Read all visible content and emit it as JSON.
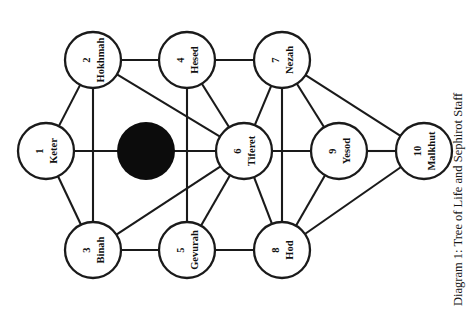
{
  "figure": {
    "caption": "Diagram 1: Tree of Life and Sephirot Staff",
    "orientation": "rotated-90-clockwise",
    "background_color": "#ffffff",
    "line_color": "#1a1a1a",
    "occluder_color": "#0c0c0c"
  },
  "diagram": {
    "title": "Tree of Life and Sephirot Staff",
    "nodes": [
      {
        "id": 1,
        "number": "1",
        "label": "Keter",
        "cx": 46,
        "cy": 151,
        "r": 28
      },
      {
        "id": 2,
        "number": "2",
        "label": "Hokhmah",
        "cx": 93,
        "cy": 60,
        "r": 28
      },
      {
        "id": 3,
        "number": "3",
        "label": "Binah",
        "cx": 93,
        "cy": 250,
        "r": 28
      },
      {
        "id": 4,
        "number": "4",
        "label": "Hesed",
        "cx": 187,
        "cy": 60,
        "r": 28
      },
      {
        "id": 5,
        "number": "5",
        "label": "Gevurah",
        "cx": 187,
        "cy": 250,
        "r": 28
      },
      {
        "id": 6,
        "number": "6",
        "label": "Tiferet",
        "cx": 244,
        "cy": 151,
        "r": 28
      },
      {
        "id": 7,
        "number": "7",
        "label": "Nezah",
        "cx": 282,
        "cy": 60,
        "r": 28
      },
      {
        "id": 8,
        "number": "8",
        "label": "Hod",
        "cx": 282,
        "cy": 250,
        "r": 28
      },
      {
        "id": 9,
        "number": "9",
        "label": "Yesod",
        "cx": 339,
        "cy": 151,
        "r": 28
      },
      {
        "id": 10,
        "number": "10",
        "label": "Malkhut",
        "cx": 424,
        "cy": 151,
        "r": 28
      }
    ],
    "edges": [
      {
        "from": 1,
        "to": 2
      },
      {
        "from": 1,
        "to": 3
      },
      {
        "from": 1,
        "to": 6
      },
      {
        "from": 2,
        "to": 3
      },
      {
        "from": 2,
        "to": 4
      },
      {
        "from": 2,
        "to": 6
      },
      {
        "from": 3,
        "to": 5
      },
      {
        "from": 3,
        "to": 6
      },
      {
        "from": 4,
        "to": 5
      },
      {
        "from": 4,
        "to": 6
      },
      {
        "from": 4,
        "to": 7
      },
      {
        "from": 5,
        "to": 6
      },
      {
        "from": 5,
        "to": 8
      },
      {
        "from": 6,
        "to": 7
      },
      {
        "from": 6,
        "to": 8
      },
      {
        "from": 6,
        "to": 9
      },
      {
        "from": 7,
        "to": 8
      },
      {
        "from": 7,
        "to": 9
      },
      {
        "from": 7,
        "to": 10
      },
      {
        "from": 8,
        "to": 9
      },
      {
        "from": 8,
        "to": 10
      },
      {
        "from": 9,
        "to": 10
      }
    ],
    "occluder": {
      "name": "black-disk",
      "cx": 146,
      "cy": 151,
      "r": 29
    }
  }
}
